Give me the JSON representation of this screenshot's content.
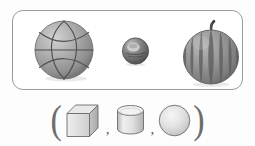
{
  "figure": {
    "caption": "",
    "panel": {
      "name": "objects-panel",
      "border_color": "#9a9a9a",
      "background": "#ffffff",
      "objects": [
        {
          "id": "basketball",
          "icon": "basketball-icon",
          "label": "basketball",
          "shape_category": "sphere",
          "fill": "#a8a8a8",
          "line_color": "#4f4f4f"
        },
        {
          "id": "small-ball",
          "icon": "ball-icon",
          "label": "small ball",
          "shape_category": "sphere",
          "fill": "#6f6f6f",
          "line_color": "#3a3a3a"
        },
        {
          "id": "watermelon",
          "icon": "watermelon-icon",
          "label": "watermelon",
          "shape_category": "sphere",
          "fill": "#8f8f8f",
          "stripe_color": "#5d5d5d",
          "stem_color": "#3c3c3c"
        }
      ]
    },
    "answer_row": {
      "name": "solids-row",
      "open_paren": "(",
      "close_paren": ")",
      "separator": ",",
      "solids": [
        {
          "id": "cube",
          "icon": "cube-icon",
          "label": "cube",
          "fill": "#dcdcdc",
          "line_color": "#6b6b6b"
        },
        {
          "id": "cylinder",
          "icon": "cylinder-icon",
          "label": "cylinder",
          "fill": "#dcdcdc",
          "line_color": "#6b6b6b"
        },
        {
          "id": "sphere",
          "icon": "sphere-icon",
          "label": "sphere",
          "fill": "#dcdcdc",
          "line_color": "#6b6b6b"
        }
      ]
    }
  }
}
